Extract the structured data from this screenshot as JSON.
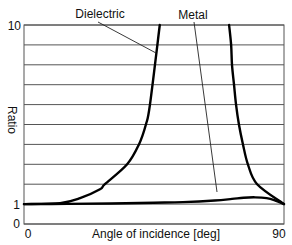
{
  "chart_data": {
    "type": "line",
    "title": "",
    "xlabel": "Angle of incidence [deg]",
    "ylabel": "Ratio",
    "xlim": [
      0,
      90
    ],
    "ylim": [
      0,
      10
    ],
    "x_tick_labels": [
      "0",
      "90"
    ],
    "y_tick_labels": [
      "0",
      "1",
      "10"
    ],
    "grid": "horizontal lines at every integer from 0 to 10",
    "legend": "none (curves labeled by annotations with leader lines)",
    "annotations": [
      "Dielectric",
      "Metal"
    ],
    "series": [
      {
        "name": "Dielectric",
        "note": "diverges near the Brewster angle; two branches",
        "branches": [
          {
            "x": [
              0,
              12.5,
              19.4,
              26.3,
              28.0,
              35.7,
              39.8,
              42.2,
              43.6,
              47.0
            ],
            "y": [
              1.0,
              1.05,
              1.3,
              1.75,
              2.0,
              3.0,
              4.0,
              5.0,
              6.0,
              10.0
            ]
          },
          {
            "x": [
              71.0,
              71.7,
              72.0,
              72.7,
              73.4,
              74.4,
              75.8,
              77.5,
              80.7,
              90.0
            ],
            "y": [
              10.0,
              9.0,
              8.0,
              7.0,
              6.0,
              5.0,
              4.0,
              3.0,
              2.0,
              1.0
            ]
          }
        ]
      },
      {
        "name": "Metal",
        "x": [
          0,
          15,
          30,
          45,
          55,
          66,
          72,
          76,
          80,
          84,
          87,
          90
        ],
        "y": [
          1.0,
          1.01,
          1.03,
          1.07,
          1.1,
          1.18,
          1.26,
          1.32,
          1.34,
          1.3,
          1.18,
          1.0
        ]
      }
    ]
  },
  "labels": {
    "dielectric": "Dielectric",
    "metal": "Metal",
    "xlabel": "Angle of incidence [deg]",
    "ylabel": "Ratio",
    "xtick_0": "0",
    "xtick_90": "90",
    "ytick_0": "0",
    "ytick_1": "1",
    "ytick_10": "10"
  },
  "colors": {
    "curve": "#000000",
    "grid": "#555555",
    "text": "#111111"
  }
}
